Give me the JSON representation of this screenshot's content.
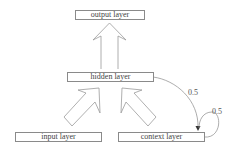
{
  "diagram": {
    "type": "elman-recurrent-network",
    "nodes": {
      "output": {
        "label": "output layer"
      },
      "hidden": {
        "label": "hidden layer"
      },
      "input": {
        "label": "input layer"
      },
      "context": {
        "label": "context layer"
      }
    },
    "edges": [
      {
        "from": "hidden",
        "to": "output",
        "style": "block-arrow"
      },
      {
        "from": "input",
        "to": "hidden",
        "style": "block-arrow"
      },
      {
        "from": "context",
        "to": "hidden",
        "style": "block-arrow"
      },
      {
        "from": "hidden",
        "to": "context",
        "style": "curve",
        "weight_label": "0.5"
      },
      {
        "from": "context",
        "to": "context",
        "style": "self-loop",
        "weight_label": "0.5"
      }
    ]
  },
  "colors": {
    "line": "#8a8a8a",
    "text": "#444444",
    "background": "#ffffff"
  }
}
